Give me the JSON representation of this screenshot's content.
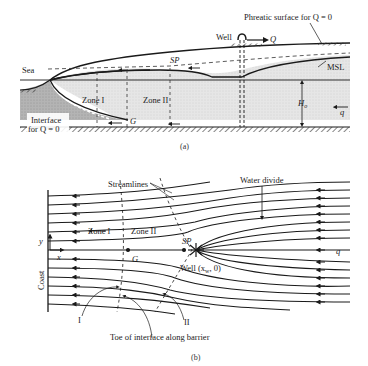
{
  "figure_a": {
    "caption": "(a)",
    "labels": {
      "sea": "Sea",
      "well": "Well",
      "Q": "Q",
      "phreatic": "Phreatic surface for Q = 0",
      "sp": "SP",
      "msl": "MSL",
      "zone1": "Zone I",
      "zone2": "Zone II",
      "interface_line1": "Interface",
      "interface_line2": "for Q = 0",
      "G": "G",
      "H0": "H",
      "H0_sub": "o",
      "q": "q"
    }
  },
  "figure_b": {
    "caption": "(b)",
    "labels": {
      "streamlines": "Streamlines",
      "water_divide": "Water divide",
      "zone1": "Zone I",
      "zone2": "Zone II",
      "y": "y",
      "x": "x",
      "coast": "Coast",
      "G": "G",
      "sp": "SP",
      "well": "Well (x",
      "well_sub": "w",
      "well_end": ", 0)",
      "q": "q",
      "I": "I",
      "II": "II",
      "toe": "Toe of interface along barrier"
    }
  },
  "colors": {
    "ink": "#1a1a1a",
    "sea_water": "#b9b9b9",
    "fresh_water": "#e4e4e4",
    "background": "#ffffff"
  }
}
